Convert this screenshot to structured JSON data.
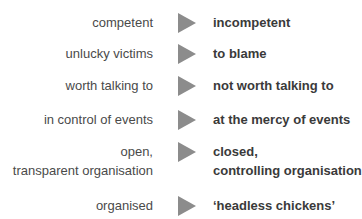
{
  "diagram": {
    "arrow_color": "#8c8c8c",
    "rows": [
      {
        "from": "competent",
        "to": "incompetent"
      },
      {
        "from": "unlucky victims",
        "to": "to blame"
      },
      {
        "from": "worth talking to",
        "to": "not worth talking to"
      },
      {
        "from": "in control of events",
        "to": "at the mercy of events"
      },
      {
        "from_line1": "open,",
        "from_line2": "transparent organisation",
        "to_line1": "closed,",
        "to_line2": "controlling organisation"
      },
      {
        "from": "organised",
        "to": "‘headless chickens’"
      }
    ]
  }
}
